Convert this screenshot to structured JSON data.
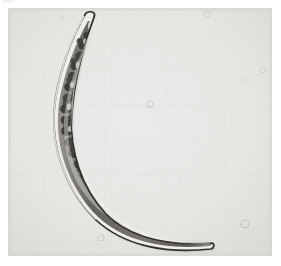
{
  "page": {
    "background_color": "#ffffff",
    "width": 281,
    "height": 266
  },
  "figure": {
    "label": "(a)",
    "caption": "",
    "plate": {
      "x": 8,
      "y": 8,
      "width": 264,
      "height": 248,
      "background_color": "#e9e9e7",
      "vignette_color": "#dcdcd8",
      "film_grain": true
    }
  },
  "subject": {
    "name": "crescent-shaped-cell",
    "description": "Elongated lunate unicellular alga (Closterium-type desmid) photographed under transmitted-light microscopy",
    "shape": "crescent",
    "orientation": "apex upper-left, apex lower-right, concave side facing upper-right",
    "outline_color": "#2e2c29",
    "wall_highlight_color": "#f7f7f5",
    "interior_color": "#6f6b63",
    "granule_color": "#312f2b",
    "apex_top": {
      "x": 90,
      "y": 14
    },
    "apex_bottom": {
      "x": 208,
      "y": 243
    },
    "midpoint": {
      "x": 72,
      "y": 132
    },
    "max_width_px": 30,
    "length_px": 255
  },
  "background_debris": [
    {
      "name": "debris-speck",
      "x": 62,
      "y": 18,
      "r": 2.2,
      "opacity": 0.22
    },
    {
      "name": "debris-speck",
      "x": 93,
      "y": 10,
      "r": 1.6,
      "opacity": 0.2
    },
    {
      "name": "bubble",
      "x": 150,
      "y": 104,
      "r": 3.4,
      "opacity": 0.3
    },
    {
      "name": "bubble",
      "x": 207,
      "y": 13,
      "r": 3.2,
      "opacity": 0.26
    },
    {
      "name": "bubble",
      "x": 263,
      "y": 70,
      "r": 2.8,
      "opacity": 0.24
    },
    {
      "name": "debris-speck",
      "x": 243,
      "y": 80,
      "r": 2.0,
      "opacity": 0.2
    },
    {
      "name": "bubble",
      "x": 245,
      "y": 224,
      "r": 4.0,
      "opacity": 0.3
    },
    {
      "name": "bubble",
      "x": 101,
      "y": 238,
      "r": 3.0,
      "opacity": 0.24
    },
    {
      "name": "debris-speck",
      "x": 133,
      "y": 30,
      "r": 1.5,
      "opacity": 0.16
    },
    {
      "name": "debris-speck",
      "x": 180,
      "y": 180,
      "r": 1.4,
      "opacity": 0.15
    }
  ],
  "metrics": {
    "modality": "light microscopy",
    "contrast": "brightfield"
  }
}
